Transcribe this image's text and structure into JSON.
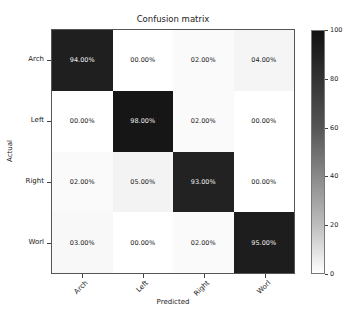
{
  "chart_data": {
    "type": "heatmap",
    "title": "Confusion matrix",
    "xlabel": "Predicted",
    "ylabel": "Actual",
    "x_categories": [
      "Arch",
      "Left",
      "Right",
      "Worl"
    ],
    "y_categories": [
      "Arch",
      "Left",
      "Right",
      "Worl"
    ],
    "values": [
      [
        94,
        0,
        2,
        4
      ],
      [
        0,
        98,
        2,
        0
      ],
      [
        2,
        5,
        93,
        0
      ],
      [
        3,
        0,
        2,
        95
      ]
    ],
    "labels": [
      [
        "94.00%",
        "00.00%",
        "02.00%",
        "04.00%"
      ],
      [
        "00.00%",
        "98.00%",
        "02.00%",
        "00.00%"
      ],
      [
        "02.00%",
        "05.00%",
        "93.00%",
        "00.00%"
      ],
      [
        "03.00%",
        "00.00%",
        "02.00%",
        "95.00%"
      ]
    ],
    "colorbar": {
      "min": 0,
      "max": 100,
      "ticks": [
        "0",
        "20",
        "40",
        "60",
        "80",
        "100"
      ],
      "colormap": "Greys"
    }
  }
}
